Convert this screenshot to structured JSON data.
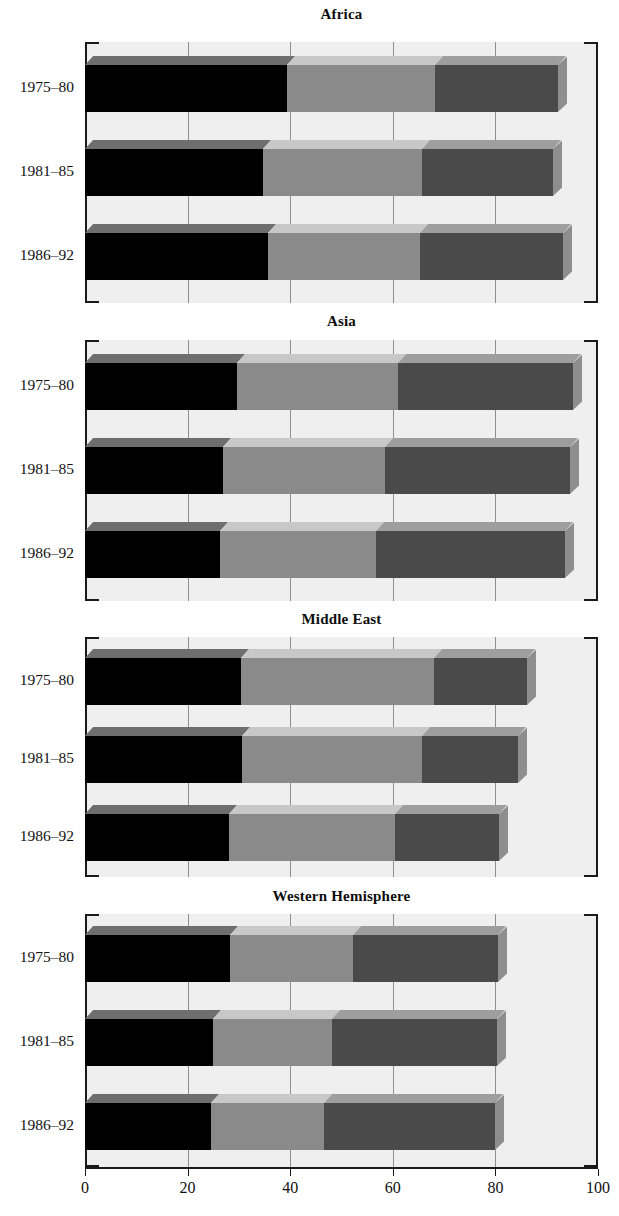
{
  "chart_data": {
    "type": "bar",
    "subtype": "stacked-horizontal-3d",
    "title": "",
    "xlabel": "",
    "ylabel": "",
    "xlim": [
      0,
      100
    ],
    "grid": true,
    "legend": "none",
    "axis": {
      "ticks": [
        0,
        20,
        40,
        60,
        80,
        100
      ],
      "tick_labels": [
        "0",
        "20",
        "40",
        "60",
        "80",
        "100"
      ]
    },
    "categories": [
      "1975–80",
      "1981–85",
      "1986–92"
    ],
    "series": [
      {
        "name": "segment-1",
        "color": "#000000"
      },
      {
        "name": "segment-2",
        "color": "#8a8a8a"
      },
      {
        "name": "segment-3",
        "color": "#4a4a4a"
      }
    ],
    "panels": [
      {
        "title": "Africa",
        "rows": [
          {
            "label": "1975–80",
            "values": [
              39.4,
              28.8,
              24.0
            ],
            "cumulative": [
              39.4,
              68.2,
              92.2
            ]
          },
          {
            "label": "1981–85",
            "values": [
              34.7,
              31.0,
              25.6
            ],
            "cumulative": [
              34.7,
              65.7,
              91.3
            ]
          },
          {
            "label": "1986–92",
            "values": [
              35.7,
              29.6,
              27.9
            ],
            "cumulative": [
              35.7,
              65.3,
              93.2
            ]
          }
        ]
      },
      {
        "title": "Asia",
        "rows": [
          {
            "label": "1975–80",
            "values": [
              29.6,
              31.4,
              34.1
            ],
            "cumulative": [
              29.6,
              61.0,
              95.1
            ]
          },
          {
            "label": "1981–85",
            "values": [
              26.9,
              31.6,
              36.0
            ],
            "cumulative": [
              26.9,
              58.5,
              94.5
            ]
          },
          {
            "label": "1986–92",
            "values": [
              26.3,
              30.4,
              36.9
            ],
            "cumulative": [
              26.3,
              56.7,
              93.6
            ]
          }
        ]
      },
      {
        "title": "Middle East",
        "rows": [
          {
            "label": "1975–80",
            "values": [
              30.4,
              37.6,
              18.1
            ],
            "cumulative": [
              30.4,
              68.0,
              86.1
            ]
          },
          {
            "label": "1981–85",
            "values": [
              30.6,
              35.1,
              18.7
            ],
            "cumulative": [
              30.6,
              65.7,
              84.4
            ]
          },
          {
            "label": "1986–92",
            "values": [
              28.1,
              32.3,
              20.3
            ],
            "cumulative": [
              28.1,
              60.4,
              80.7
            ]
          }
        ]
      },
      {
        "title": "Western Hemisphere",
        "rows": [
          {
            "label": "1975–80",
            "values": [
              28.3,
              24.0,
              28.2
            ],
            "cumulative": [
              28.3,
              52.3,
              80.5
            ]
          },
          {
            "label": "1981–85",
            "values": [
              25.0,
              23.2,
              32.1
            ],
            "cumulative": [
              25.0,
              48.2,
              80.3
            ]
          },
          {
            "label": "1986–92",
            "values": [
              24.5,
              22.1,
              33.4
            ],
            "cumulative": [
              24.5,
              46.6,
              80.0
            ]
          }
        ]
      }
    ]
  },
  "colors": {
    "segment_1": "#000000",
    "segment_2": "#8a8a8a",
    "segment_3": "#4a4a4a",
    "segment_1_top": "#6e6e6e",
    "segment_2_top": "#c8c8c8",
    "segment_3_top": "#9e9e9e",
    "segment_1_side": "#3a3a3a",
    "segment_2_side": "#bdbdbd",
    "segment_3_side": "#8e8e8e",
    "plot_background": "#efefef",
    "gridline": "#8f8f8f",
    "axis": "#1a1a1a",
    "page_background": "#ffffff"
  }
}
